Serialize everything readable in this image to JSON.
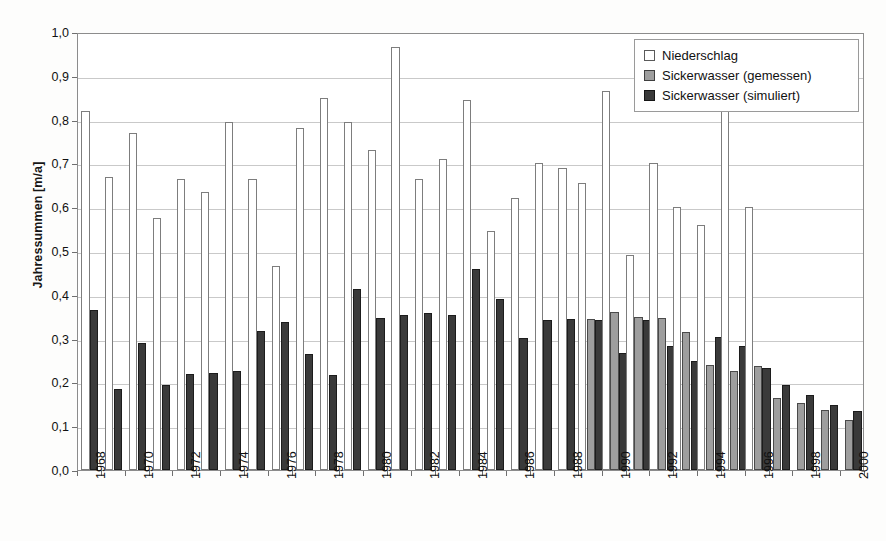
{
  "chart_data": {
    "type": "bar",
    "title": "",
    "xlabel": "",
    "ylabel": "Jahressummen [m/a]",
    "ylim": [
      0.0,
      1.0
    ],
    "ytick_labels": [
      "1,0",
      "0,9",
      "0,8",
      "0,7",
      "0,6",
      "0,5",
      "0,4",
      "0,3",
      "0,2",
      "0,1",
      "0,0"
    ],
    "ytick_values": [
      1.0,
      0.9,
      0.8,
      0.7,
      0.6,
      0.5,
      0.4,
      0.3,
      0.2,
      0.1,
      0.0
    ],
    "grid": true,
    "legend_position": "top-right",
    "categories": [
      "1968",
      "1969",
      "1970",
      "1971",
      "1972",
      "1973",
      "1974",
      "1975",
      "1976",
      "1977",
      "1978",
      "1979",
      "1980",
      "1981",
      "1982",
      "1983",
      "1984",
      "1985",
      "1986",
      "1987",
      "1988",
      "1989",
      "1990",
      "1991",
      "1992",
      "1993",
      "1994",
      "1995",
      "1996",
      "1997",
      "1998",
      "1999",
      "2000"
    ],
    "xtick_labels_shown": [
      "1968",
      "1970",
      "1972",
      "1974",
      "1976",
      "1978",
      "1980",
      "1982",
      "1984",
      "1986",
      "1988",
      "1990",
      "1992",
      "1994",
      "1996",
      "1998",
      "2000"
    ],
    "series": [
      {
        "name": "Niederschlag",
        "color": "#ffffff",
        "edge": "#7d7d7d",
        "values": [
          0.82,
          0.67,
          0.77,
          0.575,
          0.665,
          0.635,
          0.795,
          0.665,
          0.465,
          0.78,
          0.85,
          0.795,
          0.73,
          0.965,
          0.665,
          0.71,
          0.845,
          0.545,
          0.62,
          0.7,
          0.69,
          0.655,
          0.865,
          0.49,
          0.7,
          0.6,
          0.56,
          0.825,
          0.6,
          null,
          null,
          null,
          null
        ]
      },
      {
        "name": "Sickerwasser (gemessen)",
        "color": "#9e9e9e",
        "edge": "#4a4a4a",
        "values": [
          null,
          null,
          null,
          null,
          null,
          null,
          null,
          null,
          null,
          null,
          null,
          null,
          null,
          null,
          null,
          null,
          null,
          null,
          null,
          null,
          null,
          0.345,
          0.36,
          0.35,
          0.348,
          0.315,
          0.24,
          0.225,
          0.238,
          0.165,
          0.152,
          0.138,
          0.115
        ]
      },
      {
        "name": "Sickerwasser (simuliert)",
        "color": "#3a3a3a",
        "edge": "#1c1c1c",
        "values": [
          0.365,
          0.186,
          0.289,
          0.194,
          0.219,
          0.221,
          0.227,
          0.318,
          0.337,
          0.265,
          0.218,
          0.413,
          0.348,
          0.355,
          0.358,
          0.353,
          0.458,
          0.391,
          0.302,
          0.343,
          0.344,
          0.343,
          0.267,
          0.343,
          0.284,
          0.25,
          0.304,
          0.283,
          0.232,
          0.193,
          0.172,
          0.148,
          0.135
        ]
      }
    ]
  },
  "legend": {
    "items": [
      {
        "label": "Niederschlag",
        "swatch": "nieder"
      },
      {
        "label": "Sickerwasser (gemessen)",
        "swatch": "gemessen"
      },
      {
        "label": "Sickerwasser (simuliert)",
        "swatch": "simuliert"
      }
    ]
  }
}
